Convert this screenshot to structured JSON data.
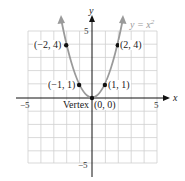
{
  "figure": {
    "equation": "y = x",
    "equation_exponent": "2",
    "x_axis_label": "x",
    "y_axis_label": "y",
    "ticks": {
      "x_min": "−5",
      "x_max": "5",
      "y_max": "5",
      "y_min": "−5"
    },
    "points": [
      {
        "label": "(−2, 4)",
        "x": -2,
        "y": 4
      },
      {
        "label": "(−1, 1)",
        "x": -1,
        "y": 1
      },
      {
        "label": "(0, 0)",
        "x": 0,
        "y": 0
      },
      {
        "label": "(1, 1)",
        "x": 1,
        "y": 1
      },
      {
        "label": "(2, 4)",
        "x": 2,
        "y": 4
      }
    ],
    "vertex_label": "Vertex",
    "colors": {
      "curve": "#9a9a9a",
      "grid": "#cccccc",
      "axis": "#111111",
      "point": "#111111"
    }
  }
}
